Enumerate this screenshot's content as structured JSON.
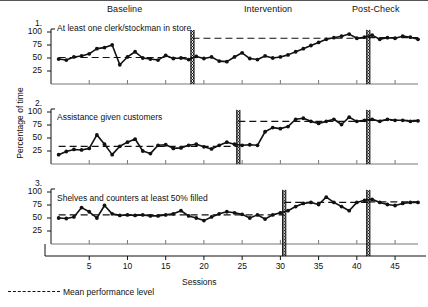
{
  "figure": {
    "ylabel": "Percentage of time",
    "xlabel": "Sessions",
    "legend_label": "Mean performance level",
    "phase_headers": [
      {
        "id": "baseline",
        "label": "Baseline"
      },
      {
        "id": "intervention",
        "label": "Intervention"
      },
      {
        "id": "postcheck",
        "label": "Post-Check"
      }
    ]
  },
  "chart_data": {
    "type": "line",
    "title": "",
    "subtitle": "",
    "xlabel": "Sessions",
    "ylabel": "Percentage of time",
    "xlim": [
      0,
      48
    ],
    "ylim": [
      0,
      100
    ],
    "xticks": [
      5,
      10,
      15,
      20,
      25,
      30,
      35,
      40,
      45
    ],
    "yticks": [
      25,
      50,
      75,
      100
    ],
    "grid": false,
    "legend_position": "below-axis",
    "legend_entries": [
      "Mean performance level"
    ],
    "phase_headers": [
      "Baseline",
      "Intervention",
      "Post-Check"
    ],
    "panels": [
      {
        "number": "1.",
        "title": "At least one clerk/stockman in store",
        "phase_lines": [
          18.5,
          41.5
        ],
        "mean_levels": [
          {
            "phase": "Baseline",
            "value": 51,
            "x_start": 1,
            "x_end": 18.5
          },
          {
            "phase": "Intervention",
            "value": 88,
            "x_start": 18.5,
            "x_end": 41.5
          },
          {
            "phase": "Post-Check",
            "value": 89,
            "x_start": 41.5,
            "x_end": 48
          }
        ],
        "x": [
          1,
          2,
          3,
          4,
          5,
          6,
          7,
          8,
          9,
          10,
          11,
          12,
          13,
          14,
          15,
          16,
          17,
          18,
          19,
          20,
          21,
          22,
          23,
          24,
          25,
          26,
          27,
          28,
          29,
          30,
          31,
          32,
          33,
          34,
          35,
          36,
          37,
          38,
          39,
          40,
          41,
          42,
          43,
          44,
          45,
          46,
          47,
          48
        ],
        "values": [
          48,
          46,
          52,
          54,
          58,
          68,
          70,
          75,
          37,
          52,
          62,
          50,
          48,
          46,
          55,
          49,
          50,
          47,
          53,
          49,
          52,
          44,
          43,
          52,
          60,
          49,
          47,
          54,
          50,
          52,
          56,
          62,
          68,
          74,
          80,
          86,
          89,
          92,
          96,
          88,
          90,
          94,
          86,
          89,
          88,
          92,
          90,
          86
        ]
      },
      {
        "number": "2.",
        "title": "Assistance given customers",
        "phase_lines": [
          24.5,
          41.5
        ],
        "mean_levels": [
          {
            "phase": "Baseline",
            "value": 34,
            "x_start": 1,
            "x_end": 24.5
          },
          {
            "phase": "Intervention",
            "value": 82,
            "x_start": 24.5,
            "x_end": 41.5
          },
          {
            "phase": "Post-Check",
            "value": 84,
            "x_start": 41.5,
            "x_end": 48
          }
        ],
        "x": [
          1,
          2,
          3,
          4,
          5,
          6,
          7,
          8,
          9,
          10,
          11,
          12,
          13,
          14,
          15,
          16,
          17,
          18,
          19,
          20,
          21,
          22,
          23,
          24,
          25,
          26,
          27,
          28,
          29,
          30,
          31,
          32,
          33,
          34,
          35,
          36,
          37,
          38,
          39,
          40,
          41,
          42,
          43,
          44,
          45,
          46,
          47,
          48
        ],
        "values": [
          18,
          24,
          28,
          27,
          30,
          56,
          38,
          18,
          34,
          42,
          48,
          25,
          20,
          36,
          37,
          30,
          31,
          36,
          38,
          33,
          29,
          36,
          42,
          38,
          36,
          37,
          36,
          62,
          70,
          68,
          72,
          86,
          88,
          82,
          78,
          82,
          86,
          76,
          90,
          82,
          84,
          86,
          82,
          86,
          84,
          84,
          82,
          83
        ]
      },
      {
        "number": "3.",
        "title": "Shelves and counters at least 50% filled",
        "phase_lines": [
          30.5,
          41.5
        ],
        "mean_levels": [
          {
            "phase": "Baseline",
            "value": 56,
            "x_start": 1,
            "x_end": 30.5
          },
          {
            "phase": "Intervention",
            "value": 80,
            "x_start": 30.5,
            "x_end": 41.5
          },
          {
            "phase": "Post-Check",
            "value": 81,
            "x_start": 41.5,
            "x_end": 48
          }
        ],
        "x": [
          1,
          2,
          3,
          4,
          5,
          6,
          7,
          8,
          9,
          10,
          11,
          12,
          13,
          14,
          15,
          16,
          17,
          18,
          19,
          20,
          21,
          22,
          23,
          24,
          25,
          26,
          27,
          28,
          29,
          30,
          31,
          32,
          33,
          34,
          35,
          36,
          37,
          38,
          39,
          40,
          41,
          42,
          43,
          44,
          45,
          46,
          47,
          48
        ],
        "values": [
          50,
          49,
          52,
          70,
          62,
          50,
          74,
          58,
          55,
          56,
          55,
          56,
          54,
          54,
          56,
          58,
          64,
          54,
          50,
          45,
          52,
          58,
          62,
          60,
          57,
          50,
          56,
          48,
          56,
          60,
          64,
          72,
          78,
          80,
          76,
          90,
          80,
          72,
          64,
          80,
          84,
          86,
          80,
          76,
          74,
          78,
          80,
          80
        ]
      }
    ]
  },
  "axis_geometry": {
    "plot_left": 51,
    "plot_right": 418,
    "x_min": 0,
    "x_max": 48,
    "panels_top": [
      32,
      112,
      192
    ],
    "panel_height": 52
  }
}
